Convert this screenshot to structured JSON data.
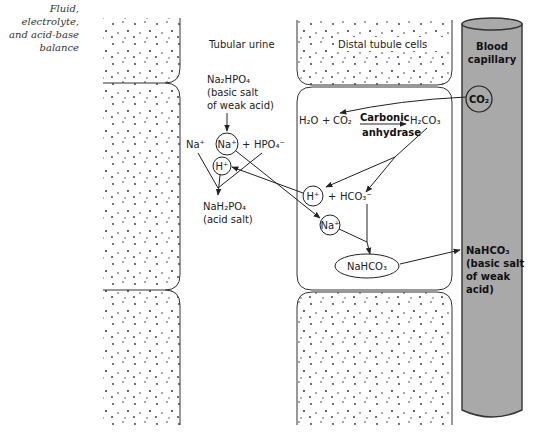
{
  "caption": {
    "lines": [
      "Fluid,",
      "electrolyte,",
      "and acid-base",
      "balance"
    ]
  },
  "regions": {
    "lumen_label": "Tubular urine",
    "cells_label": "Distal tubule cells",
    "capillary_label_1": "Blood",
    "capillary_label_2": "capillary"
  },
  "lumen": {
    "na2hpo4": "Na₂HPO₄",
    "na2hpo4_desc_1": "(basic salt",
    "na2hpo4_desc_2": "of weak acid)",
    "na_plus_left": "Na⁺",
    "na_plus_circled": "Na⁺",
    "plus": "+",
    "hpo4": "HPO₄⁻",
    "h_plus_circled": "H⁺",
    "nah2po4": "NaH₂PO₄",
    "nah2po4_desc": "(acid salt)"
  },
  "cell": {
    "h2o": "H₂O",
    "plus": "+",
    "co2": "CO₂",
    "enzyme_1": "Carbonic",
    "enzyme_2": "anhydrase",
    "h2co3": "H₂CO₃",
    "h_plus_circled": "H⁺",
    "plus2": "+",
    "hco3": "HCO₃⁻",
    "na_plus_circled": "Na⁺",
    "nahco3_oval": "NaHCO₃"
  },
  "capillary": {
    "co2_circled": "CO₂",
    "nahco3": "NaHCO₃",
    "nahco3_desc_1": "(basic salt",
    "nahco3_desc_2": "of weak",
    "nahco3_desc_3": "acid)",
    "fill_color": "#a9a9a9",
    "stroke_color": "#333333"
  }
}
